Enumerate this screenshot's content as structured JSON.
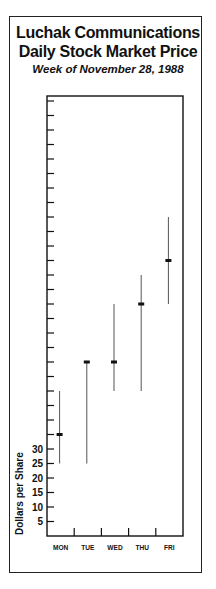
{
  "title": "Luchak Communications",
  "subtitle": "Daily Stock Market Price",
  "caption": "Week of November 28, 1988",
  "chart_data": {
    "type": "high-low-close",
    "subtitle": "Week of November 28, 1988",
    "xlabel": "",
    "ylabel": "Dollars per Share",
    "categories": [
      "MON",
      "TUE",
      "WED",
      "THU",
      "FRI"
    ],
    "series": [
      {
        "name": "High",
        "values": [
          50,
          60,
          80,
          90,
          110
        ]
      },
      {
        "name": "Low",
        "values": [
          25,
          25,
          50,
          50,
          80
        ]
      },
      {
        "name": "Close",
        "values": [
          35,
          60,
          60,
          80,
          95
        ]
      }
    ],
    "y_tick_labels": [
      "5",
      "10",
      "15",
      "20",
      "25",
      "30"
    ],
    "y_tick_step": 5,
    "ylim": [
      0,
      150
    ],
    "grid": false,
    "legend": "none"
  },
  "colors": {
    "ink": "#111111",
    "range_line": "#555555"
  }
}
